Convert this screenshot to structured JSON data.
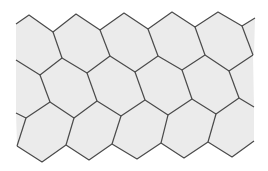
{
  "image": {
    "description": "Hexagonal tessellation pattern",
    "width": 268,
    "height": 171,
    "background": "#ffffff",
    "fill": "#ebebeb",
    "stroke": "#4a4a4a",
    "stroke_width": 1.2
  },
  "region": {
    "points": "16,24 29,15 53,32 76,14 100,30 124,13 148,29 172,12 195,27 218,12 242,26 255,18 254,55 253,55 254,107 254,141 232,157 208,142 184,158 161,143 137,159 112,144 89,160 66,145 42,162 17,146 16,113 16,60"
  },
  "edges": [
    "16,24 29,15 53,32 76,14 100,30 124,13 148,29 172,12 195,27 218,12 242,26 255,18",
    "16,60 40,75 62,58 87,73 110,56 135,72 158,56 182,70 205,55 229,71 253,55",
    "16,113 26,118 50,102 74,118 97,101 121,116 145,100 168,115 192,99 216,114 239,98 254,107",
    "17,146 42,162 66,145 89,160 112,144 137,159 161,143 184,158 208,142 232,157 254,141",
    "53,32 62,58",
    "100,30 110,56",
    "148,29 158,56",
    "195,27 205,55",
    "242,26 253,55",
    "40,75 50,102",
    "87,73 97,101",
    "135,72 145,100",
    "182,70 192,99",
    "229,71 239,98",
    "26,118 17,146",
    "74,118 66,145",
    "121,116 112,144",
    "168,115 161,143",
    "216,114 208,142"
  ]
}
